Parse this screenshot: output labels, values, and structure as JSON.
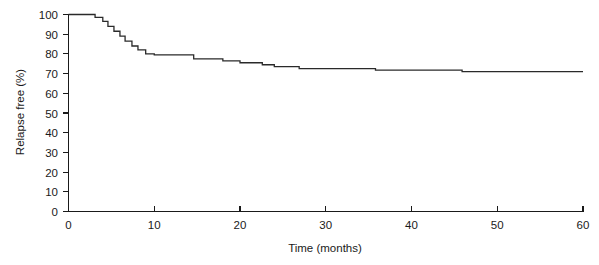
{
  "chart_data": {
    "type": "line",
    "subtype": "kaplan-meier-step",
    "title": "",
    "xlabel": "Time (months)",
    "ylabel": "Relapse free (%)",
    "xlim": [
      0,
      60
    ],
    "ylim": [
      0,
      100
    ],
    "xticks": [
      0,
      10,
      20,
      30,
      40,
      50,
      60
    ],
    "xtick_labels": [
      "0",
      "10",
      "20",
      "30",
      "40",
      "50",
      "60"
    ],
    "yticks": [
      0,
      10,
      20,
      30,
      40,
      50,
      60,
      70,
      80,
      90,
      100
    ],
    "ytick_labels": [
      "0",
      "10",
      "20",
      "30",
      "40",
      "50",
      "60",
      "70",
      "80",
      "90",
      "100"
    ],
    "grid": false,
    "legend": "none",
    "line_color": "#2a2a2a",
    "axis_color": "#1a1a1a",
    "background_color": "#ffffff",
    "series": [
      {
        "name": "Relapse free survival",
        "x": [
          0,
          3.1,
          3.1,
          4.0,
          4.0,
          4.6,
          4.6,
          5.3,
          5.3,
          6.0,
          6.0,
          6.6,
          6.6,
          7.4,
          7.4,
          8.1,
          8.1,
          9.0,
          9.0,
          10.0,
          10.0,
          14.6,
          14.6,
          18.0,
          18.0,
          20.0,
          20.0,
          22.6,
          22.6,
          24.0,
          24.0,
          26.9,
          26.9,
          35.8,
          35.8,
          45.9,
          45.9,
          60.0
        ],
        "y": [
          100,
          100,
          98.5,
          98.5,
          96.5,
          96.5,
          94.0,
          94.0,
          91.5,
          91.5,
          89.0,
          89.0,
          86.5,
          86.5,
          84.0,
          84.0,
          82.0,
          82.0,
          80.0,
          80.0,
          79.5,
          79.5,
          77.5,
          77.5,
          76.5,
          76.5,
          75.5,
          75.5,
          74.5,
          74.5,
          73.5,
          73.5,
          72.5,
          72.5,
          71.8,
          71.8,
          71.0,
          71.0
        ]
      }
    ],
    "step_events": [
      {
        "time": 3.1,
        "value": 98.5
      },
      {
        "time": 4.0,
        "value": 96.5
      },
      {
        "time": 4.6,
        "value": 94.0
      },
      {
        "time": 5.3,
        "value": 91.5
      },
      {
        "time": 6.0,
        "value": 89.0
      },
      {
        "time": 6.6,
        "value": 86.5
      },
      {
        "time": 7.4,
        "value": 84.0
      },
      {
        "time": 8.1,
        "value": 82.0
      },
      {
        "time": 9.0,
        "value": 80.0
      },
      {
        "time": 10.0,
        "value": 79.5
      },
      {
        "time": 14.6,
        "value": 77.5
      },
      {
        "time": 18.0,
        "value": 76.5
      },
      {
        "time": 20.0,
        "value": 75.5
      },
      {
        "time": 22.6,
        "value": 74.5
      },
      {
        "time": 24.0,
        "value": 73.5
      },
      {
        "time": 26.9,
        "value": 72.5
      },
      {
        "time": 35.8,
        "value": 71.8
      },
      {
        "time": 45.9,
        "value": 71.0
      }
    ]
  }
}
